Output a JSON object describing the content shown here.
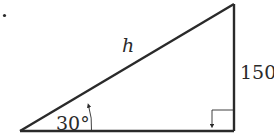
{
  "diagram": {
    "type": "right-triangle",
    "marker": "·",
    "labels": {
      "hypotenuse": "h",
      "opposite_side": "150",
      "angle": "30°"
    },
    "angle_degrees": 30,
    "opposite_length": 150,
    "right_angle_marker": true,
    "colors": {
      "stroke": "#2a2a2a",
      "background": "#ffffff"
    }
  }
}
